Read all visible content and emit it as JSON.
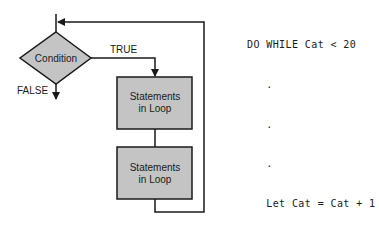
{
  "flowchart": {
    "condition_label": "Condition",
    "true_label": "TRUE",
    "false_label": "FALSE",
    "boxes": [
      {
        "line1": "Statements",
        "line2": "in Loop"
      },
      {
        "line1": "Statements",
        "line2": "in Loop"
      }
    ],
    "colors": {
      "fill": "#c4c4c4",
      "stroke": "#1a1a1a"
    }
  },
  "code": {
    "lines": [
      "DO WHILE Cat < 20",
      "   .",
      "   .",
      "   .",
      "   Let Cat = Cat + 1",
      "LOOP"
    ]
  }
}
